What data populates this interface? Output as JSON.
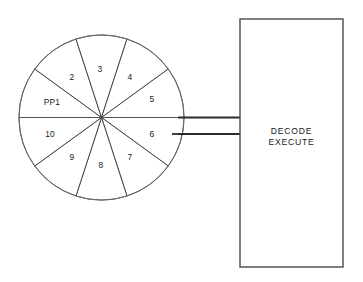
{
  "diagram": {
    "background_color": "#ffffff",
    "line_color": "#3a3a3a",
    "text_color": "#1a1a1a"
  },
  "wheel": {
    "name": "pipeline-wheel",
    "center_x": 101.5,
    "center_y": 117.5,
    "radius": 82.5,
    "sector_count": 10,
    "sectors": [
      {
        "id": "pp1",
        "label": "PP1",
        "start_angle": 180,
        "end_angle": 216,
        "label_x": 52,
        "label_y": 103
      },
      {
        "id": "s2",
        "label": "2",
        "start_angle": 216,
        "end_angle": 252,
        "label_x": 72,
        "label_y": 78
      },
      {
        "id": "s3",
        "label": "3",
        "start_angle": 252,
        "end_angle": 288,
        "label_x": 100,
        "label_y": 70
      },
      {
        "id": "s4",
        "label": "4",
        "start_angle": 288,
        "end_angle": 324,
        "label_x": 130,
        "label_y": 78
      },
      {
        "id": "s5",
        "label": "5",
        "start_angle": 324,
        "end_angle": 360,
        "label_x": 152,
        "label_y": 100
      },
      {
        "id": "s6",
        "label": "6",
        "start_angle": 0,
        "end_angle": 36,
        "label_x": 152,
        "label_y": 135
      },
      {
        "id": "s7",
        "label": "7",
        "start_angle": 36,
        "end_angle": 72,
        "label_x": 130,
        "label_y": 158
      },
      {
        "id": "s8",
        "label": "8",
        "start_angle": 72,
        "end_angle": 108,
        "label_x": 101,
        "label_y": 166
      },
      {
        "id": "s9",
        "label": "9",
        "start_angle": 108,
        "end_angle": 144,
        "label_x": 72,
        "label_y": 158
      },
      {
        "id": "s10",
        "label": "10",
        "start_angle": 144,
        "end_angle": 180,
        "label_x": 50,
        "label_y": 135
      }
    ]
  },
  "connector": {
    "name": "wheel-to-unit-bus",
    "line_top_y": 117.5,
    "line_bottom_y": 134,
    "from_x": 178,
    "to_x": 240
  },
  "diameter": {
    "name": "horizontal-diameter",
    "x1": 19,
    "x2": 184,
    "y": 117.5
  },
  "unit_box": {
    "name": "decode-execute-unit",
    "x": 240,
    "y": 19,
    "width": 103,
    "height": 248,
    "lines": [
      "DECODE",
      "EXECUTE"
    ],
    "text_x": 291.5,
    "text_line1_y": 132,
    "text_line2_y": 143
  }
}
